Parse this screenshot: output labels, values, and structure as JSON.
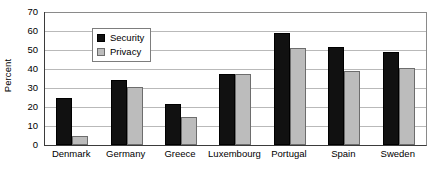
{
  "chart_data": {
    "type": "bar",
    "title": "",
    "subtitle": "",
    "xlabel": "",
    "ylabel": "Percent",
    "categories": [
      "Denmark",
      "Germany",
      "Greece",
      "Luxembourg",
      "Portugal",
      "Spain",
      "Sweden"
    ],
    "series": [
      {
        "name": "Security",
        "color": "#111111",
        "values": [
          24.5,
          34,
          21.5,
          37.5,
          59,
          51.5,
          49
        ]
      },
      {
        "name": "Privacy",
        "color": "#bcbcbc",
        "values": [
          5,
          30.5,
          15,
          37.5,
          51,
          39,
          40.5
        ]
      }
    ],
    "ylim": [
      0,
      70
    ],
    "ytick_step": 10,
    "yticks": [
      0,
      10,
      20,
      30,
      40,
      50,
      60,
      70
    ],
    "ytick_labels": [
      "0",
      "10",
      "20",
      "30",
      "40",
      "50",
      "60",
      "70"
    ],
    "grid": true,
    "grid_axis": "y",
    "legend_position": "upper-left-inside",
    "legend_entries": [
      "Security",
      "Privacy"
    ],
    "annotations": []
  },
  "axes": {
    "y_title": "Percent"
  },
  "legend": {
    "items": [
      {
        "label": "Security",
        "swatch": "black-square-swatch"
      },
      {
        "label": "Privacy",
        "swatch": "gray-square-swatch"
      }
    ]
  }
}
